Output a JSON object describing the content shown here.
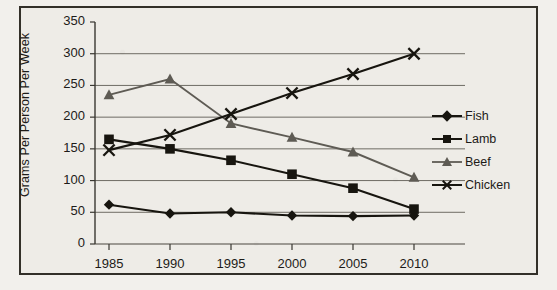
{
  "chart_data": {
    "type": "line",
    "title": "",
    "xlabel": "",
    "ylabel": "Grams Per Person Per Week",
    "categories": [
      "1985",
      "1990",
      "1995",
      "2000",
      "2005",
      "2010"
    ],
    "ylim": [
      0,
      350
    ],
    "ytick_step": 50,
    "yticks": [
      "0",
      "50",
      "100",
      "150",
      "200",
      "250",
      "300",
      "350"
    ],
    "grid": "horizontal",
    "legend_position": "right",
    "series": [
      {
        "name": "Fish",
        "marker": "diamond",
        "color": "#17150f",
        "values": [
          62,
          48,
          50,
          45,
          44,
          45
        ]
      },
      {
        "name": "Lamb",
        "marker": "square",
        "color": "#17150f",
        "values": [
          165,
          150,
          132,
          110,
          88,
          55
        ]
      },
      {
        "name": "Beef",
        "marker": "triangle",
        "color": "#5e5b54",
        "values": [
          235,
          260,
          190,
          168,
          145,
          105
        ]
      },
      {
        "name": "Chicken",
        "marker": "x",
        "color": "#17150f",
        "values": [
          148,
          172,
          205,
          238,
          268,
          300
        ]
      }
    ]
  },
  "legend": {
    "items": [
      {
        "label": "Fish"
      },
      {
        "label": "Lamb"
      },
      {
        "label": "Beef"
      },
      {
        "label": "Chicken"
      }
    ]
  },
  "axis": {
    "y_title": "Grams Per Person Per Week"
  }
}
